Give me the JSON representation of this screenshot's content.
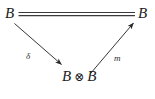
{
  "diagram": {
    "type": "commutative-diagram",
    "background_color": "#ffffff",
    "ink_color": "#1b1b1b",
    "nodes": {
      "top_left": {
        "label": "B"
      },
      "top_right": {
        "label": "B"
      },
      "bottom_left_factor": {
        "label": "B"
      },
      "bottom_right_factor": {
        "label": "B"
      },
      "tensor_symbol": {
        "label": "⊗"
      }
    },
    "edges": {
      "identity": {
        "label": "",
        "style": "double-line-equality",
        "from": "top_left",
        "to": "top_right"
      },
      "comultiplication": {
        "label": "δ",
        "style": "solid-arrow",
        "from": "top_left",
        "to": "tensor_node"
      },
      "multiplication": {
        "label": "m",
        "style": "solid-arrow",
        "from": "tensor_node",
        "to": "top_right"
      }
    }
  }
}
